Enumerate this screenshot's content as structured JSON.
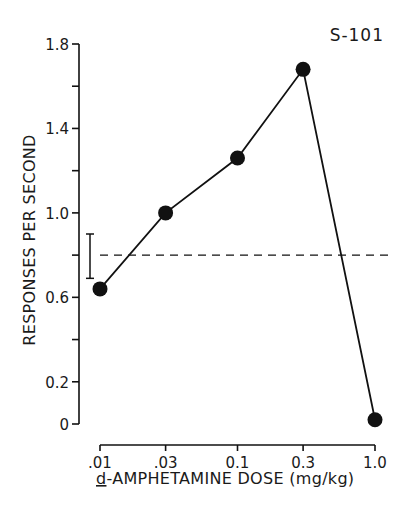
{
  "chart_data": {
    "type": "line",
    "title": "",
    "annotation": "S-101",
    "xlabel": "d-AMPHETAMINE DOSE (mg/kg)",
    "xlabel_underlined_prefix": "d",
    "xlabel_rest": "-AMPHETAMINE DOSE (mg/kg)",
    "ylabel": "RESPONSES PER SECOND",
    "x_scale": "log",
    "categories": [
      ".01",
      ".03",
      "0.1",
      "0.3",
      "1.0"
    ],
    "x": [
      0.01,
      0.03,
      0.1,
      0.3,
      1.0
    ],
    "series": [
      {
        "name": "S-101",
        "values": [
          0.64,
          1.0,
          1.26,
          1.68,
          0.02
        ],
        "marker": "filled-circle",
        "color": "#111111"
      }
    ],
    "control_line": {
      "label": "control (saline) mean",
      "value": 0.8,
      "style": "dashed"
    },
    "control_range_bar": {
      "low": 0.69,
      "high": 0.9
    },
    "y_ticks": [
      0,
      0.2,
      0.4,
      0.6,
      0.8,
      1.0,
      1.2,
      1.4,
      1.6,
      1.8
    ],
    "y_tick_labels": {
      "0": "0",
      "0.2": "0.2",
      "0.6": "0.6",
      "1.0": "1.0",
      "1.4": "1.4",
      "1.8": "1.8"
    },
    "ylim": [
      0,
      1.8
    ],
    "grid": false,
    "legend": "none"
  },
  "colors": {
    "ink": "#111111",
    "background": "#ffffff"
  }
}
